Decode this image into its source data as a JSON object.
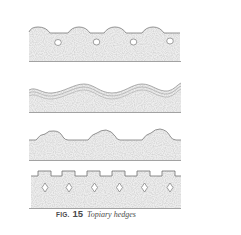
{
  "figure": {
    "label": "FIG.",
    "number": "15",
    "title": "Topiary hedges"
  },
  "hedges": [
    {
      "style": "scalloped-with-round-openings"
    },
    {
      "style": "wavy-banded"
    },
    {
      "style": "double-humped-arches"
    },
    {
      "style": "crenellated-with-diamond-openings"
    }
  ],
  "colors": {
    "ink": "#7a7a7a",
    "fill": "#ececec",
    "background": "#ffffff"
  }
}
